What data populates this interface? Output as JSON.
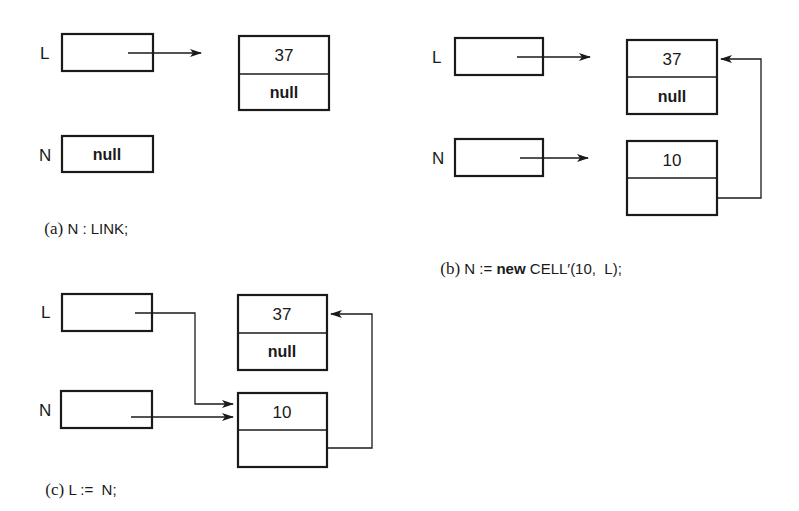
{
  "panels": {
    "a": {
      "caption_tag": "(a)",
      "caption_code": " N : LINK;",
      "var_L": {
        "label": "L",
        "content": ""
      },
      "var_N": {
        "label": "N",
        "content": "null"
      },
      "cell_37": {
        "value": "37",
        "next": "null"
      }
    },
    "b": {
      "caption_tag": "(b)",
      "caption_pre": " N := ",
      "caption_keyword": "new",
      "caption_post": " CELL′(10,  L);",
      "var_L": {
        "label": "L",
        "content": ""
      },
      "var_N": {
        "label": "N",
        "content": ""
      },
      "cell_37": {
        "value": "37",
        "next": "null"
      },
      "cell_10": {
        "value": "10",
        "next": ""
      }
    },
    "c": {
      "caption_tag": "(c)",
      "caption_code": " L :=  N;",
      "var_L": {
        "label": "L",
        "content": ""
      },
      "var_N": {
        "label": "N",
        "content": ""
      },
      "cell_37": {
        "value": "37",
        "next": "null"
      },
      "cell_10": {
        "value": "10",
        "next": ""
      }
    }
  },
  "colors": {
    "ink": "#1a1a1a",
    "paper": "#ffffff"
  }
}
